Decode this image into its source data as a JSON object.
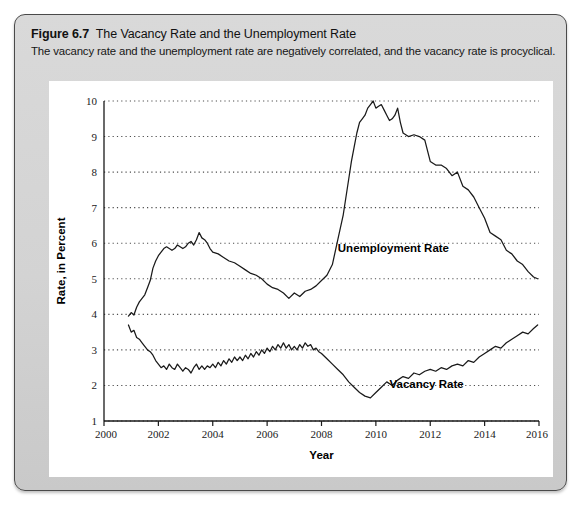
{
  "figure": {
    "label": "Figure 6.7",
    "title": "The Vacancy Rate and the Unemployment Rate",
    "subtitle": "The vacancy rate and the unemployment rate are negatively correlated, and the vacancy rate is procyclical."
  },
  "colors": {
    "panel_background": "#d6d6d6",
    "panel_border": "#4a4a4a",
    "plot_background": "#ffffff",
    "line": "#1a1a1a",
    "gridline": "#4d4d4d",
    "axis": "#1a1a1a",
    "text": "#111111"
  },
  "chart_data": {
    "type": "line",
    "title": "The Vacancy Rate and the Unemployment Rate",
    "subtitle": "The vacancy rate and the unemployment rate are negatively correlated, and the vacancy rate is procyclical.",
    "xlabel": "Year",
    "ylabel": "Rate, in Percent",
    "xlim": [
      2000,
      2016
    ],
    "ylim": [
      1,
      10
    ],
    "xticks": [
      2000,
      2002,
      2004,
      2006,
      2008,
      2010,
      2012,
      2014,
      2016
    ],
    "xtick_labels": [
      "2000",
      "2002",
      "2004",
      "2006",
      "2008",
      "2010",
      "2012",
      "2014",
      "2016"
    ],
    "yticks": [
      1,
      2,
      3,
      4,
      5,
      6,
      7,
      8,
      9,
      10
    ],
    "ytick_labels": [
      "1",
      "2",
      "3",
      "4",
      "5",
      "6",
      "7",
      "8",
      "9",
      "10"
    ],
    "grid": "horizontal-dotted",
    "legend": "inline-annotations",
    "annotations": [
      {
        "text": "Unemployment Rate",
        "x": 2008.6,
        "y": 5.75
      },
      {
        "text": "Vacancy Rate",
        "x": 2010.5,
        "y": 1.92
      }
    ],
    "series": [
      {
        "name": "Unemployment Rate",
        "x": [
          2000.9,
          2001.0,
          2001.1,
          2001.2,
          2001.3,
          2001.4,
          2001.5,
          2001.6,
          2001.7,
          2001.8,
          2001.9,
          2002.0,
          2002.1,
          2002.2,
          2002.3,
          2002.4,
          2002.5,
          2002.6,
          2002.7,
          2002.8,
          2002.9,
          2003.0,
          2003.1,
          2003.2,
          2003.3,
          2003.4,
          2003.5,
          2003.6,
          2003.7,
          2003.8,
          2003.9,
          2004.0,
          2004.2,
          2004.4,
          2004.6,
          2004.8,
          2005.0,
          2005.2,
          2005.4,
          2005.6,
          2005.8,
          2006.0,
          2006.2,
          2006.4,
          2006.6,
          2006.8,
          2007.0,
          2007.2,
          2007.4,
          2007.6,
          2007.8,
          2008.0,
          2008.2,
          2008.4,
          2008.6,
          2008.8,
          2009.0,
          2009.1,
          2009.2,
          2009.3,
          2009.4,
          2009.5,
          2009.6,
          2009.7,
          2009.8,
          2009.9,
          2010.0,
          2010.1,
          2010.2,
          2010.3,
          2010.4,
          2010.5,
          2010.6,
          2010.7,
          2010.8,
          2010.9,
          2011.0,
          2011.2,
          2011.4,
          2011.6,
          2011.8,
          2012.0,
          2012.2,
          2012.4,
          2012.6,
          2012.8,
          2013.0,
          2013.2,
          2013.4,
          2013.6,
          2013.8,
          2014.0,
          2014.2,
          2014.4,
          2014.6,
          2014.8,
          2015.0,
          2015.2,
          2015.4,
          2015.6,
          2015.8,
          2015.95
        ],
        "values": [
          3.95,
          4.05,
          3.98,
          4.2,
          4.35,
          4.45,
          4.55,
          4.75,
          4.95,
          5.3,
          5.5,
          5.65,
          5.75,
          5.85,
          5.9,
          5.85,
          5.8,
          5.85,
          5.95,
          5.9,
          5.85,
          5.9,
          6.0,
          6.05,
          5.95,
          6.1,
          6.3,
          6.15,
          6.1,
          6.0,
          5.85,
          5.75,
          5.7,
          5.6,
          5.5,
          5.45,
          5.35,
          5.25,
          5.15,
          5.1,
          5.0,
          4.85,
          4.75,
          4.7,
          4.6,
          4.45,
          4.6,
          4.5,
          4.65,
          4.7,
          4.8,
          4.95,
          5.1,
          5.4,
          6.1,
          6.8,
          7.8,
          8.3,
          8.7,
          9.1,
          9.4,
          9.5,
          9.6,
          9.8,
          9.9,
          10.0,
          9.8,
          9.85,
          9.9,
          9.75,
          9.6,
          9.45,
          9.5,
          9.6,
          9.8,
          9.4,
          9.1,
          9.0,
          9.05,
          9.0,
          8.9,
          8.3,
          8.2,
          8.2,
          8.1,
          7.9,
          8.0,
          7.6,
          7.5,
          7.3,
          7.0,
          6.7,
          6.3,
          6.2,
          6.1,
          5.8,
          5.7,
          5.5,
          5.4,
          5.2,
          5.05,
          5.0
        ]
      },
      {
        "name": "Vacancy Rate",
        "x": [
          2000.9,
          2001.0,
          2001.1,
          2001.2,
          2001.3,
          2001.4,
          2001.5,
          2001.6,
          2001.7,
          2001.8,
          2001.9,
          2002.0,
          2002.1,
          2002.2,
          2002.3,
          2002.4,
          2002.5,
          2002.6,
          2002.7,
          2002.8,
          2002.9,
          2003.0,
          2003.1,
          2003.2,
          2003.3,
          2003.4,
          2003.5,
          2003.6,
          2003.7,
          2003.8,
          2003.9,
          2004.0,
          2004.1,
          2004.2,
          2004.3,
          2004.4,
          2004.5,
          2004.6,
          2004.7,
          2004.8,
          2004.9,
          2005.0,
          2005.1,
          2005.2,
          2005.3,
          2005.4,
          2005.5,
          2005.6,
          2005.7,
          2005.8,
          2005.9,
          2006.0,
          2006.1,
          2006.2,
          2006.3,
          2006.4,
          2006.5,
          2006.6,
          2006.7,
          2006.8,
          2006.9,
          2007.0,
          2007.1,
          2007.2,
          2007.3,
          2007.4,
          2007.5,
          2007.6,
          2007.7,
          2007.8,
          2007.9,
          2008.0,
          2008.2,
          2008.4,
          2008.6,
          2008.8,
          2009.0,
          2009.2,
          2009.4,
          2009.6,
          2009.8,
          2010.0,
          2010.2,
          2010.4,
          2010.6,
          2010.8,
          2011.0,
          2011.2,
          2011.4,
          2011.6,
          2011.8,
          2012.0,
          2012.2,
          2012.4,
          2012.6,
          2012.8,
          2013.0,
          2013.2,
          2013.4,
          2013.6,
          2013.8,
          2014.0,
          2014.2,
          2014.4,
          2014.6,
          2014.8,
          2015.0,
          2015.2,
          2015.4,
          2015.6,
          2015.8,
          2015.95
        ],
        "values": [
          3.7,
          3.5,
          3.55,
          3.35,
          3.3,
          3.2,
          3.1,
          3.0,
          2.95,
          2.85,
          2.7,
          2.6,
          2.5,
          2.55,
          2.45,
          2.6,
          2.5,
          2.45,
          2.6,
          2.5,
          2.4,
          2.5,
          2.45,
          2.35,
          2.5,
          2.6,
          2.45,
          2.55,
          2.45,
          2.55,
          2.5,
          2.6,
          2.5,
          2.65,
          2.55,
          2.7,
          2.6,
          2.75,
          2.65,
          2.8,
          2.7,
          2.8,
          2.7,
          2.85,
          2.75,
          2.9,
          2.8,
          2.95,
          2.85,
          3.0,
          2.9,
          3.05,
          2.95,
          3.1,
          3.0,
          3.15,
          3.05,
          3.2,
          3.05,
          3.15,
          3.0,
          3.1,
          3.0,
          3.15,
          3.05,
          3.2,
          3.1,
          3.15,
          3.0,
          3.05,
          2.95,
          2.9,
          2.75,
          2.6,
          2.45,
          2.3,
          2.1,
          1.95,
          1.8,
          1.7,
          1.65,
          1.8,
          1.95,
          2.1,
          2.0,
          2.15,
          2.25,
          2.2,
          2.35,
          2.3,
          2.4,
          2.45,
          2.4,
          2.5,
          2.45,
          2.55,
          2.6,
          2.55,
          2.7,
          2.65,
          2.8,
          2.9,
          3.0,
          3.1,
          3.05,
          3.2,
          3.3,
          3.4,
          3.5,
          3.45,
          3.6,
          3.7
        ]
      }
    ]
  }
}
